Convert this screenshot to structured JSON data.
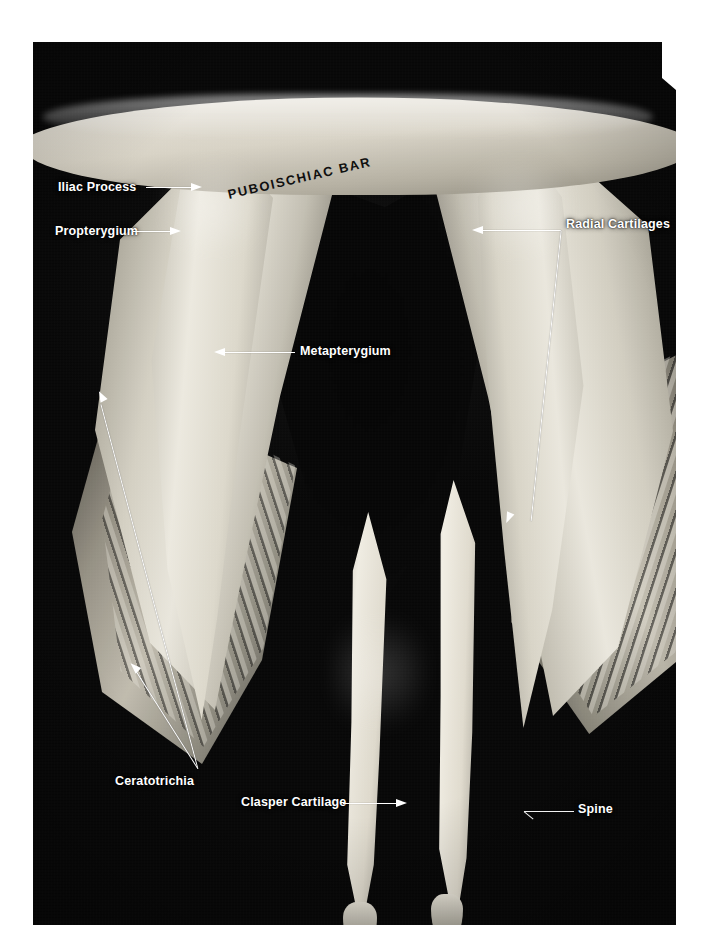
{
  "figure": {
    "kind": "anatomical-photograph",
    "background_color": "#ffffff",
    "photo_color": "#0a0a0a",
    "label_color": "#ffffff",
    "dark_label_color": "#101010"
  },
  "labels": {
    "iliac_process": "Iliac Process",
    "propterygium": "Propterygium",
    "puboischiac_bar": "PUBOISCHIAC BAR",
    "radial_cartilages": "Radial Cartilages",
    "metapterygium": "Metapterygium",
    "ceratotrichia": "Ceratotrichia",
    "clasper_cartilage": "Clasper Cartilage",
    "spine": "Spine"
  }
}
